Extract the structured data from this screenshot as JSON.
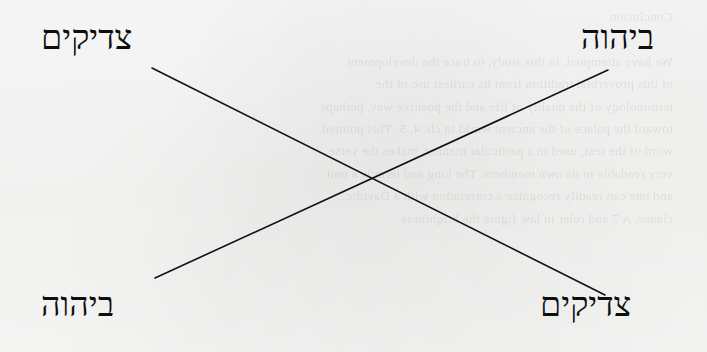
{
  "figure": {
    "type": "chiasm-diagram",
    "background_color": "#fafafa",
    "ink_color": "#0e0e0e",
    "labels": {
      "top_left": "צדיקים",
      "top_right": "ביהוה",
      "bottom_left": "ביהוה",
      "bottom_right": "צדיקים"
    },
    "lines": [
      {
        "name": "tzadikim-to-tzadikim",
        "from": {
          "x": 152,
          "y": 68
        },
        "to": {
          "x": 605,
          "y": 295
        }
      },
      {
        "name": "byhwh-to-byhwh",
        "from": {
          "x": 608,
          "y": 70
        },
        "to": {
          "x": 155,
          "y": 278
        }
      }
    ],
    "intersection": {
      "x": 375,
      "y": 181
    },
    "line_width": 1.6
  },
  "bleed_through": {
    "note": "faint mirrored show-through text from the reverse side of the scanned page",
    "text": "Conclusion\n\nWe have attempted, in this study, to trace the development\nof this proverbial tradition from its earliest use of the\nterminology of the quality of life and the positive way, perhaps\ntoward the palace of the ancient world in ch. 4, 5. This pointed\nword of the text, used in a particular manner, makes the verse\nvery readable in its own members. The long and term is a unit\nand one can readily recognize a correlation with a Davidic\nclause. A 7 and ruler in law figure the brightness"
  }
}
